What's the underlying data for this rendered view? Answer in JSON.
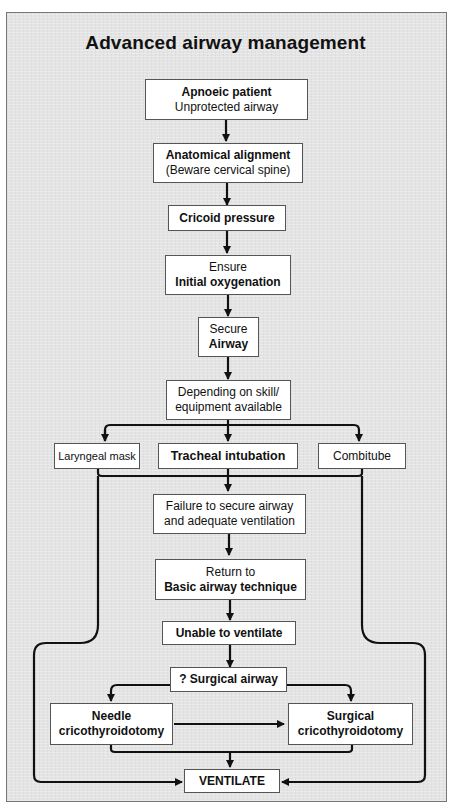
{
  "title": "Advanced airway management",
  "nodes": {
    "apnoeic": {
      "line1": "Apnoeic patient",
      "line2": "Unprotected airway"
    },
    "alignment": {
      "line1": "Anatomical alignment",
      "line2": "(Beware cervical spine)"
    },
    "cricoid": {
      "line1": "Cricoid pressure"
    },
    "oxygenation": {
      "line1": "Ensure",
      "line2": "Initial oxygenation"
    },
    "secure": {
      "line1": "Secure",
      "line2": "Airway"
    },
    "depending": {
      "line1": "Depending on skill/",
      "line2": "equipment available"
    },
    "laryngeal": {
      "line1": "Laryngeal mask"
    },
    "tracheal": {
      "line1": "Tracheal intubation"
    },
    "combitube": {
      "line1": "Combitube"
    },
    "failure": {
      "line1": "Failure to secure airway",
      "line2": "and adequate ventilation"
    },
    "return": {
      "line1": "Return to",
      "line2": "Basic airway technique"
    },
    "unable": {
      "line1": "Unable to ventilate"
    },
    "surgical_q": {
      "line1": "? Surgical airway"
    },
    "needle": {
      "line1": "Needle",
      "line2": "cricothyroidotomy"
    },
    "surgical": {
      "line1": "Surgical",
      "line2": "cricothyroidotomy"
    },
    "ventilate": {
      "line1": "VENTILATE"
    }
  }
}
